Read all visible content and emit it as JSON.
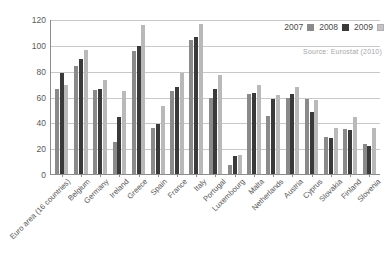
{
  "chart_data": {
    "type": "bar",
    "title": "",
    "xlabel": "",
    "ylabel": "",
    "ylim": [
      0,
      120
    ],
    "ytick_labels": [
      "0",
      "20",
      "40",
      "60",
      "80",
      "100",
      "120"
    ],
    "yticks": [
      0,
      20,
      40,
      60,
      80,
      100,
      120
    ],
    "grid": true,
    "legend_position": "top-right",
    "source": "Source:  Eurostat (2010)",
    "categories": [
      "Euro area (16 countries)",
      "Belgium",
      "Germany",
      "Ireland",
      "Greece",
      "Spain",
      "France",
      "Italy",
      "Portugal",
      "Luxembourg",
      "Malta",
      "Netherlands",
      "Austria",
      "Cyprus",
      "Slovakia",
      "Finland",
      "Slovenia"
    ],
    "series": [
      {
        "name": "2007",
        "color": "#8a8a8a",
        "values": [
          66,
          84,
          65,
          25,
          95,
          36,
          64,
          104,
          59,
          7,
          62,
          45,
          59,
          58,
          29,
          35,
          23
        ]
      },
      {
        "name": "2008",
        "color": "#3a3a3a",
        "values": [
          78,
          89,
          66,
          44,
          99,
          39,
          67,
          106,
          66,
          14,
          63,
          58,
          62,
          48,
          28,
          34,
          22
        ]
      },
      {
        "name": "2009",
        "color": "#b9b9b9",
        "values": [
          69,
          96,
          73,
          64,
          115,
          53,
          78,
          116,
          77,
          15,
          69,
          61,
          67,
          57,
          36,
          44,
          36
        ]
      }
    ]
  },
  "legend": {
    "entries": [
      {
        "label": "2007",
        "swatch": "legend-swatch-2007"
      },
      {
        "label": "2008",
        "swatch": "legend-swatch-2008"
      },
      {
        "label": "2009",
        "swatch": "legend-swatch-2009"
      }
    ]
  }
}
